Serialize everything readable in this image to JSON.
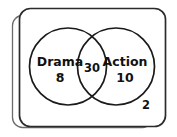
{
  "diagram": {
    "type": "venn",
    "title": "",
    "universe": {
      "label": "",
      "outside_count": "2"
    },
    "sets": [
      {
        "id": "drama",
        "label": "Drama",
        "count": "8"
      },
      {
        "id": "action",
        "label": "Action",
        "count": "10"
      }
    ],
    "intersection": {
      "label": "",
      "count": "30"
    },
    "colors": {
      "background": "#ffffff",
      "circle_stroke": "#1a1a1a",
      "frame_stroke_front": "#2b2b2b",
      "frame_stroke_back": "#6a6a6a",
      "text": "#111111"
    }
  }
}
